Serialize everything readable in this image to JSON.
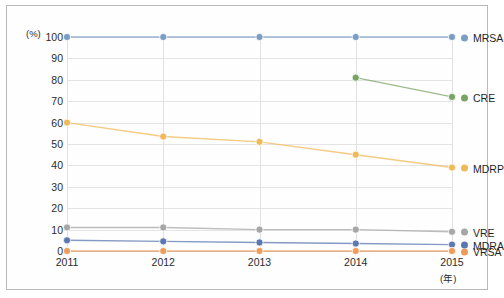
{
  "chart_data": {
    "type": "line",
    "title": "",
    "xlabel": "(年)",
    "ylabel": "(%)",
    "categories": [
      "2011",
      "2012",
      "2013",
      "2014",
      "2015"
    ],
    "x": [
      2011,
      2012,
      2013,
      2014,
      2015
    ],
    "ylim": [
      0,
      100
    ],
    "xlim": [
      2011,
      2015
    ],
    "yticks": [
      0,
      10,
      20,
      30,
      40,
      50,
      60,
      70,
      80,
      90,
      100
    ],
    "grid": true,
    "legend_position": "right",
    "series": [
      {
        "name": "MRSA",
        "color": "#7b9dc4",
        "values": [
          100,
          100,
          100,
          100,
          100
        ]
      },
      {
        "name": "CRE",
        "color": "#79a466",
        "values": [
          null,
          null,
          null,
          81,
          72
        ]
      },
      {
        "name": "MDRP",
        "color": "#f0b95a",
        "values": [
          60,
          53.5,
          51,
          45,
          39
        ]
      },
      {
        "name": "VRE",
        "color": "#a6a6a6",
        "values": [
          11,
          11,
          10,
          10,
          9
        ]
      },
      {
        "name": "MDRA",
        "color": "#5b78b0",
        "values": [
          5,
          4.5,
          4,
          3.5,
          3
        ]
      },
      {
        "name": "VRSA",
        "color": "#ef9b59",
        "values": [
          0,
          0,
          0,
          0,
          0
        ]
      }
    ]
  }
}
